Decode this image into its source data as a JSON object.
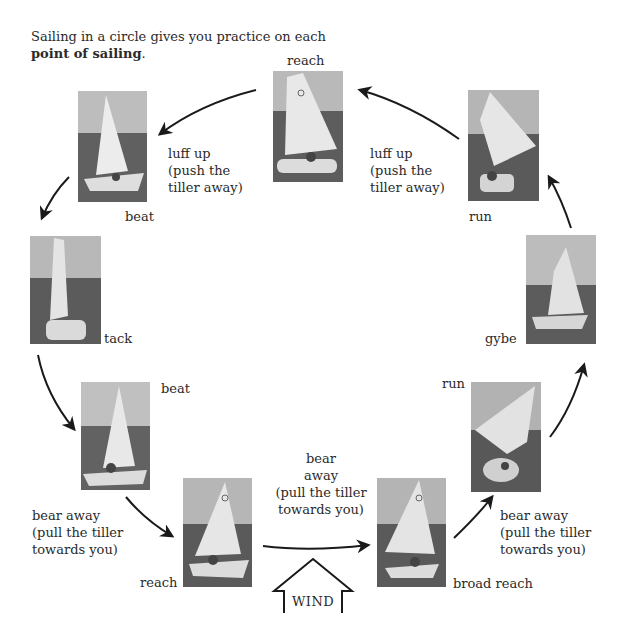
{
  "intro": {
    "text_before": "Sailing in a circle gives you practice on each ",
    "bold": "point of sailing",
    "text_after": "."
  },
  "photos": [
    {
      "id": "reach-top",
      "label": "reach"
    },
    {
      "id": "beat-top-left",
      "label": "beat"
    },
    {
      "id": "run-top-right",
      "label": "run"
    },
    {
      "id": "tack",
      "label": "tack"
    },
    {
      "id": "gybe",
      "label": "gybe"
    },
    {
      "id": "beat-left",
      "label": "beat"
    },
    {
      "id": "run-right",
      "label": "run"
    },
    {
      "id": "reach-bottom",
      "label": "reach"
    },
    {
      "id": "broad-reach",
      "label": "broad reach"
    }
  ],
  "instructions": {
    "luff_up_left": "luff up\n(push the\ntiller away)",
    "luff_up_right": "luff up\n(push the\ntiller away)",
    "bear_away_left": "bear away\n(pull the tiller\ntowards you)",
    "bear_away_center": "bear\naway\n(pull the tiller\ntowards you)",
    "bear_away_right": "bear away\n(pull the tiller\ntowards you)"
  },
  "wind": {
    "label": "WIND"
  },
  "colors": {
    "ink": "#1a1a1a",
    "text": "#2a2a2a",
    "background": "#ffffff"
  }
}
